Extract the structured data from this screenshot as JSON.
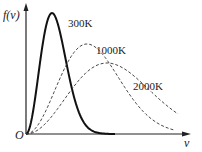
{
  "chart_data": {
    "type": "line",
    "xlabel": "v",
    "ylabel": "f(v)",
    "origin_label": "O",
    "grid": false,
    "series": [
      {
        "name": "300K",
        "style": "solid",
        "peak_x_px": 52,
        "peak_y_px": 13
      },
      {
        "name": "1000K",
        "style": "dashed",
        "peak_x_px": 87,
        "peak_y_px": 44
      },
      {
        "name": "2000K",
        "style": "dashed",
        "peak_x_px": 107,
        "peak_y_px": 63
      }
    ]
  },
  "labels": {
    "y_axis": "f(v)",
    "x_axis": "v",
    "origin": "O",
    "s300": "300K",
    "s1000": "1000K",
    "s2000": "2000K"
  }
}
